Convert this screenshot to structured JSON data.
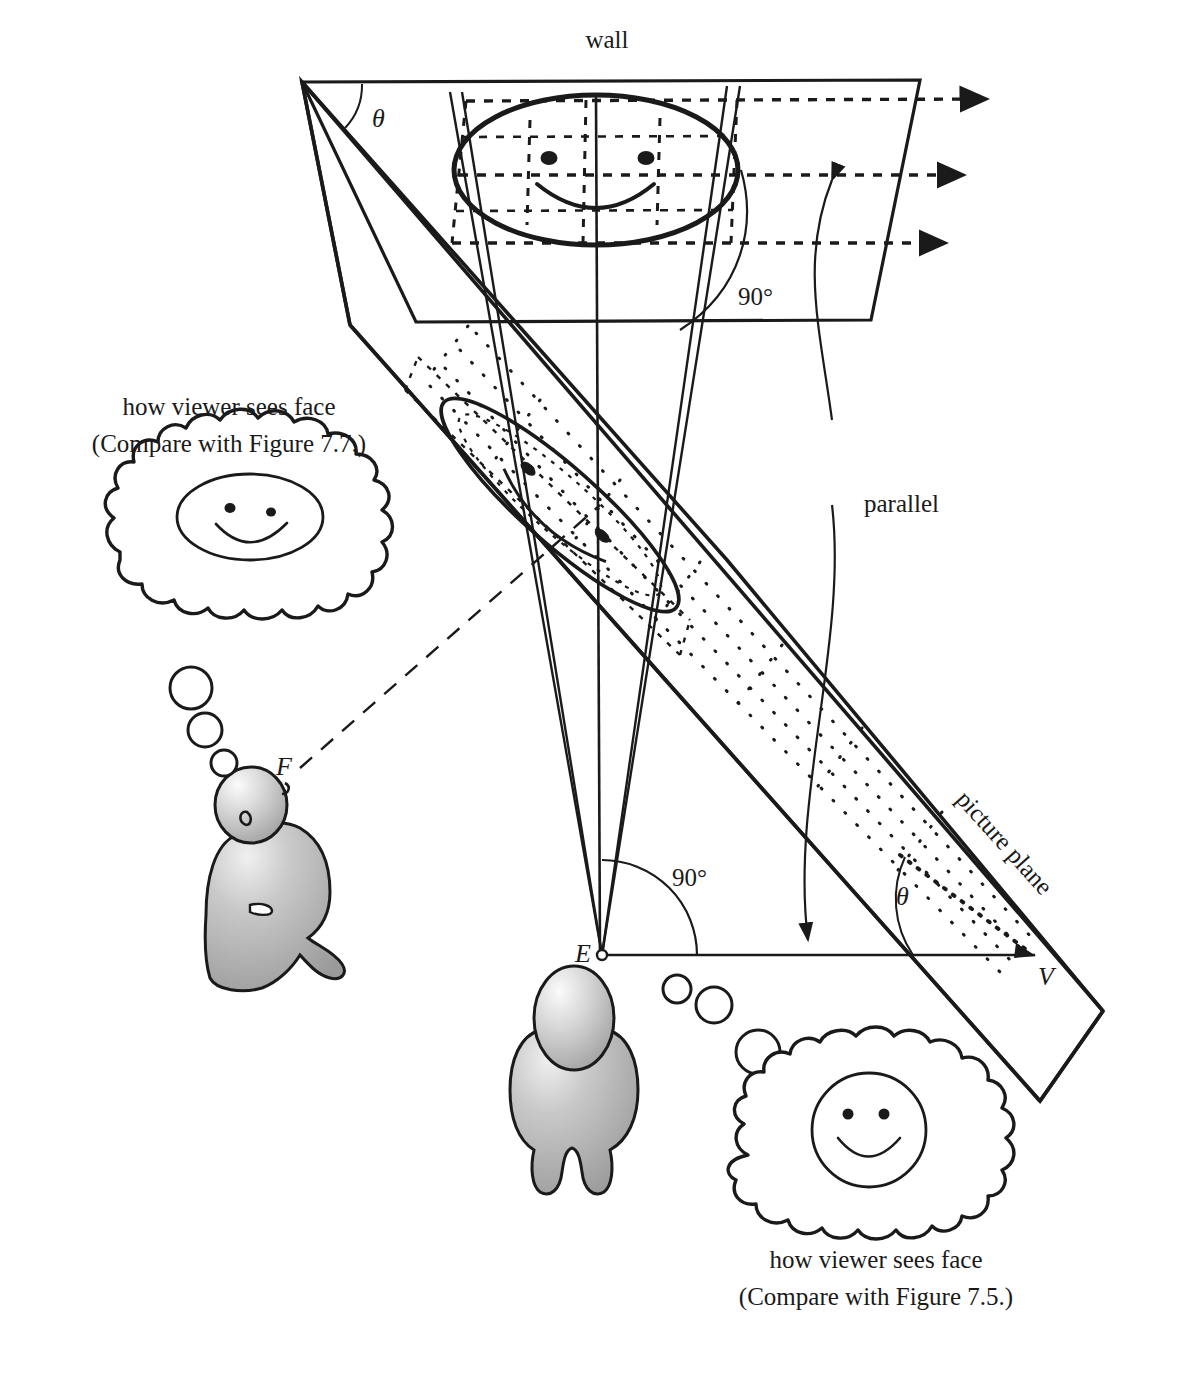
{
  "figure": {
    "title_labels": {
      "wall": "wall",
      "picture_plane": "picture plane",
      "parallel": "parallel",
      "theta_wall": "θ",
      "theta_ground": "θ",
      "right_angle_wall": "90°",
      "right_angle_ground": "90°",
      "point_E": "E",
      "point_F": "F",
      "point_V": "V"
    },
    "left_caption": {
      "line1": "how viewer sees face",
      "line2": "(Compare with Figure 7.7.)"
    },
    "right_caption": {
      "line1": "how viewer sees face",
      "line2": "(Compare with Figure 7.5.)"
    },
    "colors": {
      "ink": "#1a1a1a",
      "figure_fill": "#a8a8a8",
      "figure_highlight": "#f2f2f2",
      "paper": "#ffffff"
    },
    "icons": {
      "left_thought_bubble": "thought-bubble-icon",
      "right_thought_bubble": "thought-bubble-icon",
      "smiley_ellipse": "smiley-face-icon",
      "smiley_circle": "smiley-face-icon",
      "viewer_left": "person-figure-icon",
      "viewer_right": "person-figure-icon"
    }
  }
}
